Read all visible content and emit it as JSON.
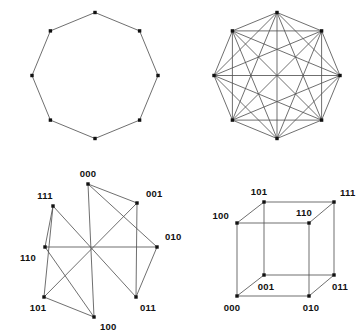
{
  "figure": {
    "background_color": "#ffffff",
    "edge_color": "#555555",
    "node_color": "#111111",
    "label_color": "#111111",
    "panels": [
      {
        "id": "cycle-octagon",
        "name": "cycle-graph-c8",
        "position": "top-left",
        "description": "Regular octagon cycle graph with 8 vertices",
        "center": [
          95,
          75.5
        ],
        "radius": 63,
        "vertex_count": 8,
        "edge_count": 8,
        "labels": []
      },
      {
        "id": "complete-octagon",
        "name": "complete-graph-k8",
        "position": "top-right",
        "description": "Complete graph on 8 vertices drawn on an octagon",
        "center": [
          277,
          75.5
        ],
        "radius": 63,
        "vertex_count": 8,
        "edge_count": 28,
        "labels": []
      },
      {
        "id": "hypercube-circular",
        "name": "hypercube-q3-circular-layout",
        "position": "bottom-left",
        "description": "3-cube graph with vertices placed on a circle, binary labelled",
        "center": [
          90,
          251
        ],
        "radius": 67,
        "vertex_count": 8,
        "edge_count": 12,
        "labels": [
          "000",
          "001",
          "010",
          "011",
          "100",
          "101",
          "110",
          "111"
        ]
      },
      {
        "id": "hypercube-cube",
        "name": "hypercube-q3-cube-layout",
        "position": "bottom-right",
        "description": "3-cube drawn in perspective with binary labelled corners",
        "vertex_count": 8,
        "edge_count": 12,
        "labels": [
          "000",
          "001",
          "010",
          "011",
          "100",
          "101",
          "110",
          "111"
        ]
      }
    ]
  },
  "chart_data": {
    "type": "diagram",
    "title": "",
    "panels": [
      {
        "name": "cycle-graph-c8",
        "graph_type": "cycle",
        "nodes": [
          {
            "id": "v0",
            "label": "",
            "x": 95.0,
            "y": 12.5
          },
          {
            "id": "v1",
            "label": "",
            "x": 139.6,
            "y": 30.9
          },
          {
            "id": "v2",
            "label": "",
            "x": 158.0,
            "y": 75.5
          },
          {
            "id": "v3",
            "label": "",
            "x": 139.6,
            "y": 120.1
          },
          {
            "id": "v4",
            "label": "",
            "x": 95.0,
            "y": 138.5
          },
          {
            "id": "v5",
            "label": "",
            "x": 50.4,
            "y": 120.1
          },
          {
            "id": "v6",
            "label": "",
            "x": 32.0,
            "y": 75.5
          },
          {
            "id": "v7",
            "label": "",
            "x": 50.4,
            "y": 30.9
          }
        ],
        "edges": [
          [
            "v0",
            "v1"
          ],
          [
            "v1",
            "v2"
          ],
          [
            "v2",
            "v3"
          ],
          [
            "v3",
            "v4"
          ],
          [
            "v4",
            "v5"
          ],
          [
            "v5",
            "v6"
          ],
          [
            "v6",
            "v7"
          ],
          [
            "v7",
            "v0"
          ]
        ]
      },
      {
        "name": "complete-graph-k8",
        "graph_type": "complete",
        "nodes": [
          {
            "id": "w0",
            "label": "",
            "x": 277.0,
            "y": 12.5
          },
          {
            "id": "w1",
            "label": "",
            "x": 321.6,
            "y": 30.9
          },
          {
            "id": "w2",
            "label": "",
            "x": 340.0,
            "y": 75.5
          },
          {
            "id": "w3",
            "label": "",
            "x": 321.6,
            "y": 120.1
          },
          {
            "id": "w4",
            "label": "",
            "x": 277.0,
            "y": 138.5
          },
          {
            "id": "w5",
            "label": "",
            "x": 232.4,
            "y": 120.1
          },
          {
            "id": "w6",
            "label": "",
            "x": 214.0,
            "y": 75.5
          },
          {
            "id": "w7",
            "label": "",
            "x": 232.4,
            "y": 30.9
          }
        ],
        "edges": [
          [
            "w0",
            "w1"
          ],
          [
            "w0",
            "w2"
          ],
          [
            "w0",
            "w3"
          ],
          [
            "w0",
            "w4"
          ],
          [
            "w0",
            "w5"
          ],
          [
            "w0",
            "w6"
          ],
          [
            "w0",
            "w7"
          ],
          [
            "w1",
            "w2"
          ],
          [
            "w1",
            "w3"
          ],
          [
            "w1",
            "w4"
          ],
          [
            "w1",
            "w5"
          ],
          [
            "w1",
            "w6"
          ],
          [
            "w1",
            "w7"
          ],
          [
            "w2",
            "w3"
          ],
          [
            "w2",
            "w4"
          ],
          [
            "w2",
            "w5"
          ],
          [
            "w2",
            "w6"
          ],
          [
            "w2",
            "w7"
          ],
          [
            "w3",
            "w4"
          ],
          [
            "w3",
            "w5"
          ],
          [
            "w3",
            "w6"
          ],
          [
            "w3",
            "w7"
          ],
          [
            "w4",
            "w5"
          ],
          [
            "w4",
            "w6"
          ],
          [
            "w4",
            "w7"
          ],
          [
            "w5",
            "w6"
          ],
          [
            "w5",
            "w7"
          ],
          [
            "w6",
            "w7"
          ]
        ]
      },
      {
        "name": "hypercube-q3-circular-layout",
        "graph_type": "hypercube",
        "nodes": [
          {
            "id": "000",
            "label": "000",
            "x": 88.0,
            "y": 184.0,
            "label_x": 88.0,
            "label_y": 177.0,
            "label_anchor": "middle"
          },
          {
            "id": "001",
            "label": "001",
            "x": 137.0,
            "y": 203.0,
            "label_x": 146.0,
            "label_y": 197.0,
            "label_anchor": "start"
          },
          {
            "id": "010",
            "label": "010",
            "x": 157.0,
            "y": 247.0,
            "label_x": 165.0,
            "label_y": 240.0,
            "label_anchor": "start"
          },
          {
            "id": "011",
            "label": "011",
            "x": 136.0,
            "y": 297.0,
            "label_x": 140.0,
            "label_y": 311.0,
            "label_anchor": "start"
          },
          {
            "id": "100",
            "label": "100",
            "x": 94.0,
            "y": 317.0,
            "label_x": 100.0,
            "label_y": 330.0,
            "label_anchor": "start"
          },
          {
            "id": "101",
            "label": "101",
            "x": 44.0,
            "y": 297.0,
            "label_x": 38.0,
            "label_y": 311.0,
            "label_anchor": "middle"
          },
          {
            "id": "110",
            "label": "110",
            "x": 45.0,
            "y": 247.0,
            "label_x": 36.0,
            "label_y": 261.0,
            "label_anchor": "end"
          },
          {
            "id": "111",
            "label": "111",
            "x": 53.0,
            "y": 206.0,
            "label_x": 45.0,
            "label_y": 199.0,
            "label_anchor": "middle"
          }
        ],
        "edges": [
          [
            "000",
            "001"
          ],
          [
            "000",
            "010"
          ],
          [
            "000",
            "100"
          ],
          [
            "001",
            "011"
          ],
          [
            "001",
            "101"
          ],
          [
            "010",
            "011"
          ],
          [
            "010",
            "110"
          ],
          [
            "011",
            "111"
          ],
          [
            "100",
            "101"
          ],
          [
            "100",
            "110"
          ],
          [
            "101",
            "111"
          ],
          [
            "110",
            "111"
          ]
        ]
      },
      {
        "name": "hypercube-q3-cube-layout",
        "graph_type": "hypercube",
        "nodes": [
          {
            "id": "000",
            "label": "000",
            "x": 237.0,
            "y": 296.0,
            "label_x": 232.0,
            "label_y": 311.0,
            "label_anchor": "middle"
          },
          {
            "id": "001",
            "label": "001",
            "x": 264.0,
            "y": 275.0,
            "label_x": 266.0,
            "label_y": 290.0,
            "label_anchor": "middle"
          },
          {
            "id": "010",
            "label": "010",
            "x": 309.0,
            "y": 296.0,
            "label_x": 311.0,
            "label_y": 311.0,
            "label_anchor": "middle"
          },
          {
            "id": "011",
            "label": "011",
            "x": 334.0,
            "y": 275.0,
            "label_x": 340.0,
            "label_y": 290.0,
            "label_anchor": "middle"
          },
          {
            "id": "100",
            "label": "100",
            "x": 237.0,
            "y": 223.0,
            "label_x": 229.0,
            "label_y": 219.0,
            "label_anchor": "end"
          },
          {
            "id": "101",
            "label": "101",
            "x": 264.0,
            "y": 202.0,
            "label_x": 259.0,
            "label_y": 195.0,
            "label_anchor": "middle"
          },
          {
            "id": "110",
            "label": "110",
            "x": 309.0,
            "y": 223.0,
            "label_x": 304.0,
            "label_y": 216.0,
            "label_anchor": "middle"
          },
          {
            "id": "111",
            "label": "111",
            "x": 334.0,
            "y": 202.0,
            "label_x": 340.0,
            "label_y": 196.0,
            "label_anchor": "start"
          }
        ],
        "edges": [
          [
            "000",
            "001"
          ],
          [
            "000",
            "010"
          ],
          [
            "000",
            "100"
          ],
          [
            "001",
            "011"
          ],
          [
            "001",
            "101"
          ],
          [
            "010",
            "011"
          ],
          [
            "010",
            "110"
          ],
          [
            "011",
            "111"
          ],
          [
            "100",
            "101"
          ],
          [
            "100",
            "110"
          ],
          [
            "101",
            "111"
          ],
          [
            "110",
            "111"
          ]
        ]
      }
    ]
  }
}
